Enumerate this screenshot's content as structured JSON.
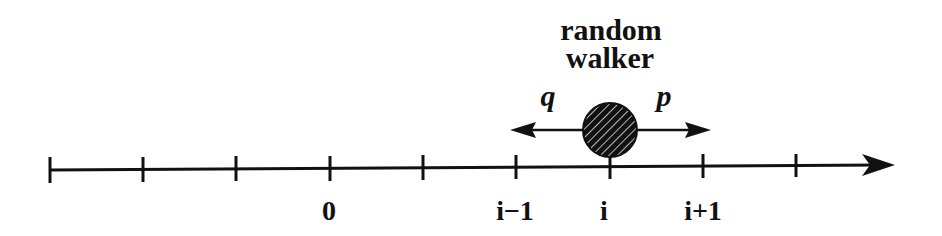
{
  "title": {
    "line1": "random",
    "line2": "walker"
  },
  "probabilities": {
    "left": "q",
    "right": "p"
  },
  "axis": {
    "ticks": [
      {
        "x": 50,
        "label": ""
      },
      {
        "x": 143,
        "label": ""
      },
      {
        "x": 236,
        "label": ""
      },
      {
        "x": 330,
        "label": "0"
      },
      {
        "x": 423,
        "label": ""
      },
      {
        "x": 516,
        "label": "i−1"
      },
      {
        "x": 610,
        "label": "i"
      },
      {
        "x": 703,
        "label": "i+1"
      },
      {
        "x": 796,
        "label": ""
      }
    ],
    "arrow_end_x": 895
  },
  "walker": {
    "position_label": "i",
    "fill": "hatched"
  },
  "colors": {
    "ink": "#111111",
    "background": "#ffffff"
  }
}
